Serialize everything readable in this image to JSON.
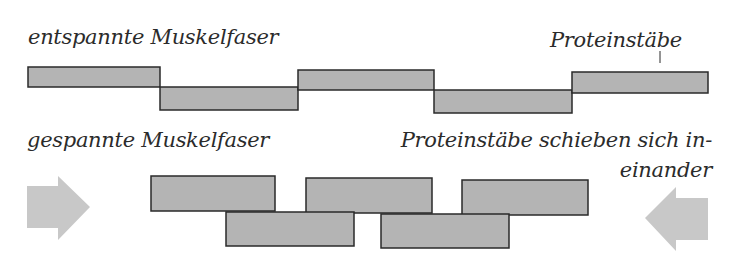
{
  "labels": {
    "relaxed": "entspannte Muskelfaser",
    "rods": "Proteinstäbe",
    "contracted": "gespannte Muskelfaser",
    "sliding_line1": "Proteinstäbe schieben sich in-",
    "sliding_line2": "einander"
  },
  "colors": {
    "bar_fill": "#b4b4b4",
    "bar_stroke": "#2a2a2a",
    "arrow_fill": "#c8c8c8",
    "text": "#2b2b2b"
  },
  "relaxed_bars": [
    {
      "x": 28,
      "y": 67,
      "w": 132,
      "h": 20
    },
    {
      "x": 160,
      "y": 87,
      "w": 138,
      "h": 23
    },
    {
      "x": 298,
      "y": 70,
      "w": 136,
      "h": 20
    },
    {
      "x": 434,
      "y": 90,
      "w": 138,
      "h": 23
    },
    {
      "x": 572,
      "y": 72,
      "w": 136,
      "h": 21
    }
  ],
  "contracted_bars": [
    {
      "x": 151,
      "y": 176,
      "w": 124,
      "h": 35
    },
    {
      "x": 306,
      "y": 178,
      "w": 126,
      "h": 35
    },
    {
      "x": 462,
      "y": 180,
      "w": 126,
      "h": 35
    },
    {
      "x": 226,
      "y": 212,
      "w": 128,
      "h": 34
    },
    {
      "x": 381,
      "y": 214,
      "w": 128,
      "h": 34
    }
  ],
  "arrows": {
    "left_pointing_right": "27,186 58,186 58,176 90,207 58,240 58,228 27,228",
    "right_pointing_left": "708,198 676,198 676,187 645,218 676,251 676,240 708,240"
  }
}
